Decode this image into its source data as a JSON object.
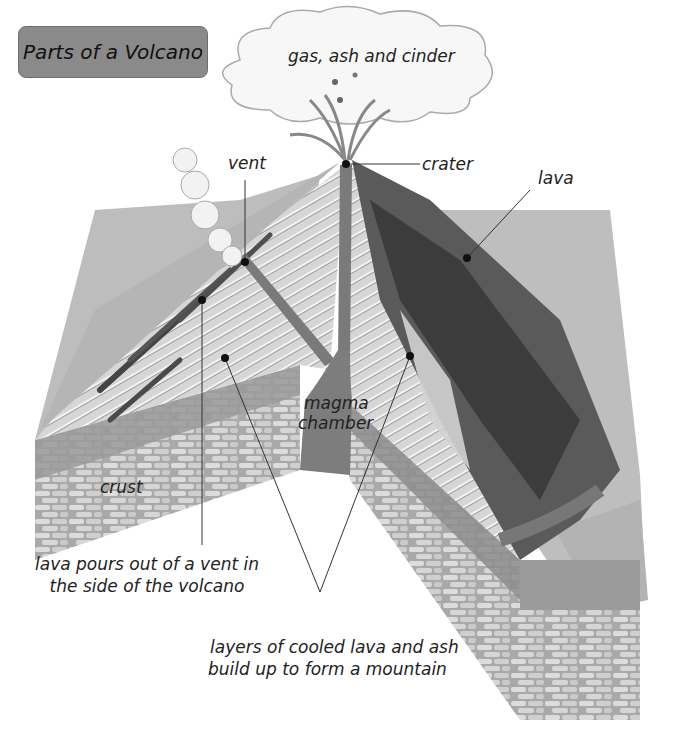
{
  "title": "Parts of a Volcano",
  "labels": {
    "gas": "gas, ash and cinder",
    "vent": "vent",
    "crater": "crater",
    "lava": "lava",
    "magma_line1": "magma",
    "magma_line2": "chamber",
    "crust": "crust",
    "side_vent_line1": "lava pours out of a vent in",
    "side_vent_line2": "the side of the volcano",
    "layers_line1": "layers of cooled lava and ash",
    "layers_line2": "build up to form a mountain"
  },
  "colors": {
    "title_bg": "#8a8a8a",
    "ground": "#b9b9b9",
    "cone_layers": "#d4d4d4",
    "lava_dark": "#4a4a4a",
    "magma": "#7d7d7d",
    "crust": "#9d9d9d",
    "cloud": "#f6f6f6"
  }
}
